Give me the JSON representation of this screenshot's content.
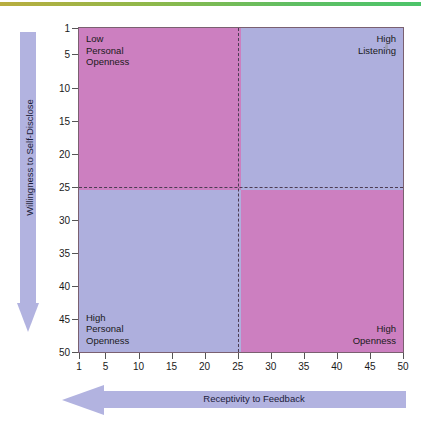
{
  "chart_data": {
    "type": "scatter",
    "title": "",
    "xlabel": "Receptivity to Feedback",
    "ylabel": "Willingness to Self-Disclose",
    "xlim": [
      1,
      50
    ],
    "ylim": [
      1,
      50
    ],
    "x_ticks": [
      "1",
      "5",
      "10",
      "15",
      "20",
      "25",
      "30",
      "35",
      "40",
      "45",
      "50"
    ],
    "y_ticks": [
      "1",
      "5",
      "10",
      "15",
      "20",
      "25",
      "30",
      "35",
      "40",
      "45",
      "50"
    ],
    "x_axis_direction": "left",
    "y_axis_direction": "down",
    "grid": false,
    "legend": "none",
    "divider_x": 25,
    "divider_y": 25,
    "divider_style": "dashed",
    "annotations": [
      {
        "quadrant": "top-left",
        "label": "Low\nPersonal\nOpenness",
        "color": "#cc7fc0"
      },
      {
        "quadrant": "top-right",
        "label": "High\nListening",
        "color": "#aeafdd"
      },
      {
        "quadrant": "bottom-left",
        "label": "High\nPersonal\nOpenness",
        "color": "#aeafdd"
      },
      {
        "quadrant": "bottom-right",
        "label": "High\nOpenness",
        "color": "#cc7fc0"
      }
    ],
    "series": []
  },
  "colors": {
    "pink": "#cc7fc0",
    "blue": "#aeafdd",
    "arrow": "#b2b3e0",
    "dash": "#4b3b52",
    "frame": "#7a6070",
    "top_rule": "#5fbe63"
  },
  "plot": {
    "quadrants": {
      "top_left": {
        "label": "Low\nPersonal\nOpenness"
      },
      "top_right": {
        "label": "High\nListening"
      },
      "bottom_left": {
        "label": "High\nPersonal\nOpenness"
      },
      "bottom_right": {
        "label": "High\nOpenness"
      }
    }
  },
  "axes": {
    "y": {
      "title": "Willingness to Self-Disclose"
    },
    "x": {
      "title": "Receptivity to Feedback"
    }
  }
}
